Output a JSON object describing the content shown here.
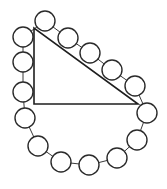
{
  "diagram": {
    "width": 167,
    "height": 189,
    "background": "#ffffff",
    "stroke_color": "#2a2a2a",
    "accent_color": "#c0392b",
    "circle_radius": 10,
    "triangle": {
      "type": "right-triangle",
      "vertices": [
        [
          34,
          28
        ],
        [
          34,
          104
        ],
        [
          138,
          104
        ]
      ]
    },
    "circles": [
      {
        "id": 1,
        "cx": 45,
        "cy": 21
      },
      {
        "id": 2,
        "cx": 68,
        "cy": 38
      },
      {
        "id": 3,
        "cx": 90,
        "cy": 53
      },
      {
        "id": 4,
        "cx": 112,
        "cy": 70
      },
      {
        "id": 5,
        "cx": 135,
        "cy": 86
      },
      {
        "id": 6,
        "cx": 147,
        "cy": 113
      },
      {
        "id": 7,
        "cx": 137,
        "cy": 140
      },
      {
        "id": 8,
        "cx": 117,
        "cy": 158
      },
      {
        "id": 9,
        "cx": 89,
        "cy": 165
      },
      {
        "id": 10,
        "cx": 61,
        "cy": 162
      },
      {
        "id": 11,
        "cx": 38,
        "cy": 146
      },
      {
        "id": 12,
        "cx": 25,
        "cy": 118
      },
      {
        "id": 13,
        "cx": 23,
        "cy": 92
      },
      {
        "id": 14,
        "cx": 23,
        "cy": 62
      },
      {
        "id": 15,
        "cx": 23,
        "cy": 37
      }
    ],
    "circle_count": 15,
    "closed_loop": true
  }
}
